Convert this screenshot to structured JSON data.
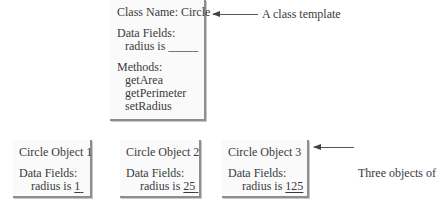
{
  "template": {
    "class_name": "Class Name: Circle",
    "fields_header": "Data Fields:",
    "field_line": "radius is _____",
    "methods_header": "Methods:",
    "methods": [
      "getArea",
      "getPerimeter",
      "setRadius"
    ]
  },
  "template_annotation": "A class template",
  "objects": [
    {
      "title": "Circle Object 1",
      "fields_header": "Data Fields:",
      "field_prefix": "radius is ",
      "value": "1"
    },
    {
      "title": "Circle Object 2",
      "fields_header": "Data Fields:",
      "field_prefix": "radius is ",
      "value": "25"
    },
    {
      "title": "Circle Object 3",
      "fields_header": "Data Fields:",
      "field_prefix": "radius is ",
      "value": "125"
    }
  ],
  "objects_annotation": [
    "Three objects of",
    "the Circle class"
  ]
}
